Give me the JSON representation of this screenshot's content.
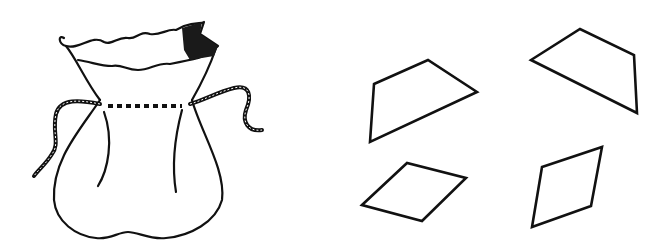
{
  "figure": {
    "caption": "",
    "background": "#ffffff",
    "stroke_color": "#111111",
    "items": [
      {
        "name": "drawstring-bag",
        "description": "Drawstring bag line drawing"
      },
      {
        "name": "quadrilateral-1",
        "type": "trapezoid",
        "points": "374,84 428,60 477,92 370,142"
      },
      {
        "name": "quadrilateral-2",
        "type": "trapezoid",
        "points": "531,60 580,29 634,55 637,113"
      },
      {
        "name": "quadrilateral-3",
        "type": "rhombus",
        "points": "362,205 407,163 466,178 422,221"
      },
      {
        "name": "quadrilateral-4",
        "type": "rhombus",
        "points": "542,167 602,147 591,206 532,227"
      }
    ]
  }
}
